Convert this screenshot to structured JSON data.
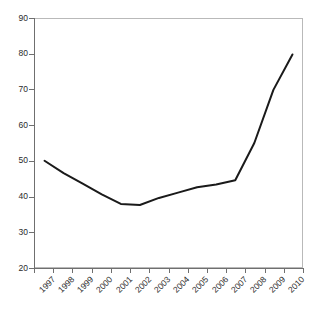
{
  "chart_data": {
    "type": "line",
    "title": "",
    "subtitle": "",
    "xlabel": "",
    "ylabel": "",
    "categories": [
      "1997",
      "1998",
      "1999",
      "2000",
      "2001",
      "2002",
      "2003",
      "2004",
      "2005",
      "2006",
      "2007",
      "2008",
      "2009",
      "2010"
    ],
    "values": [
      50,
      46.5,
      43.5,
      40.5,
      37.8,
      37.5,
      39.5,
      41,
      42.5,
      43.3,
      44.5,
      55,
      70,
      80
    ],
    "series": [
      {
        "name": "",
        "values": [
          50,
          46.5,
          43.5,
          40.5,
          37.8,
          37.5,
          39.5,
          41,
          42.5,
          43.3,
          44.5,
          55,
          70,
          80
        ],
        "color": "#1a1a1a"
      }
    ],
    "ylim": [
      20,
      90
    ],
    "yticks": [
      20,
      30,
      40,
      50,
      60,
      70,
      80,
      90
    ],
    "ytick_labels": [
      "20",
      "30",
      "40",
      "50",
      "60",
      "70",
      "80",
      "90"
    ],
    "xtick_labels": [
      "1997",
      "1998",
      "1999",
      "2000",
      "2001",
      "2002",
      "2003",
      "2004",
      "2005",
      "2006",
      "2007",
      "2008",
      "2009",
      "2010"
    ],
    "grid": false,
    "legend": false,
    "legend_position": "none",
    "line_color": "#1a1a1a",
    "line_width": 2,
    "markers": false,
    "plot_background": "#ffffff",
    "frame_color": "#b9b9b9",
    "axis_color": "#6f6f6f",
    "tick_label_color": "#2b2b2b",
    "xtick_rotation": -45
  }
}
